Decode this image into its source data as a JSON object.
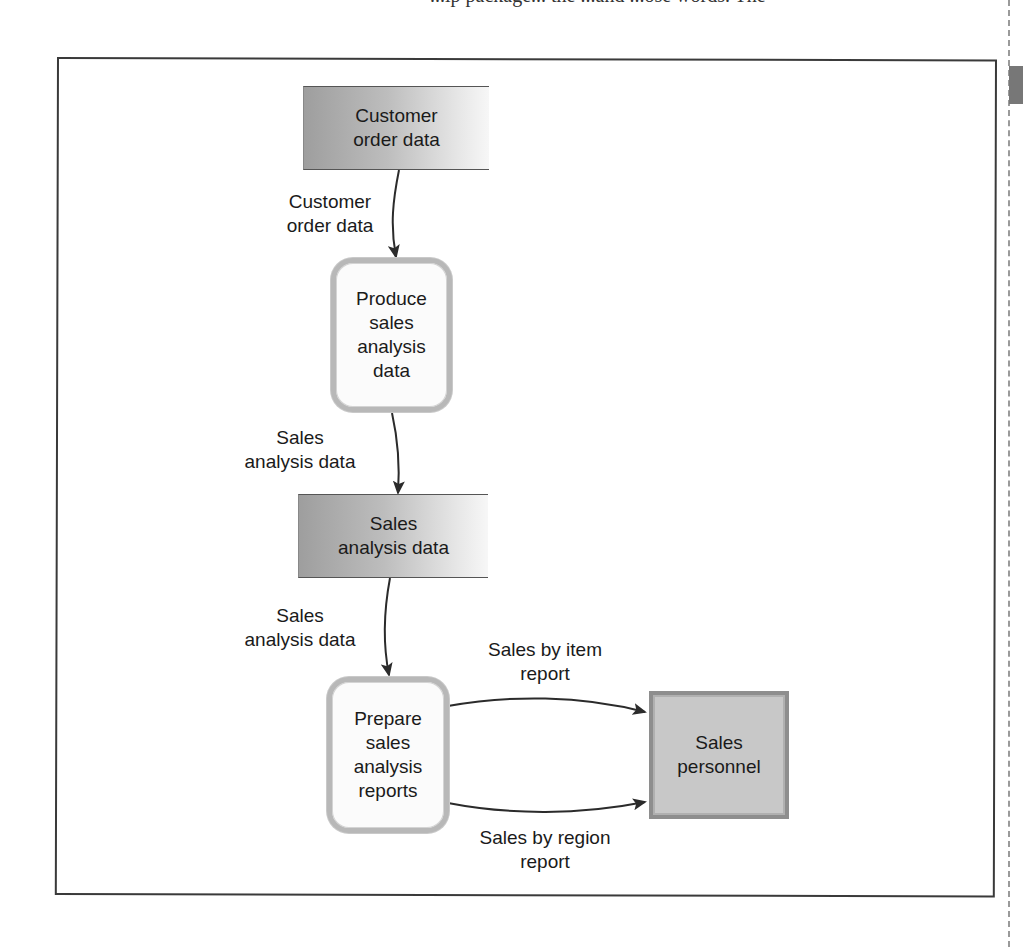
{
  "page": {
    "top_text_fragment": "...ip package... the ...and ...ose words. The"
  },
  "diagram": {
    "type": "data-flow-diagram",
    "data_stores": [
      {
        "id": "store-customer-order",
        "line1": "Customer",
        "line2": "order data"
      },
      {
        "id": "store-sales-analysis",
        "line1": "Sales",
        "line2": "analysis data"
      }
    ],
    "processes": [
      {
        "id": "process-produce",
        "line1": "Produce",
        "line2": "sales",
        "line3": "analysis",
        "line4": "data"
      },
      {
        "id": "process-prepare",
        "line1": "Prepare",
        "line2": "sales",
        "line3": "analysis",
        "line4": "reports"
      }
    ],
    "entities": [
      {
        "id": "entity-sales-personnel",
        "line1": "Sales",
        "line2": "personnel"
      }
    ],
    "flows": [
      {
        "from": "store-customer-order",
        "to": "process-produce",
        "line1": "Customer",
        "line2": "order data"
      },
      {
        "from": "process-produce",
        "to": "store-sales-analysis",
        "line1": "Sales",
        "line2": "analysis data"
      },
      {
        "from": "store-sales-analysis",
        "to": "process-prepare",
        "line1": "Sales",
        "line2": "analysis data"
      },
      {
        "from": "process-prepare",
        "to": "entity-sales-personnel",
        "line1": "Sales by item",
        "line2": "report"
      },
      {
        "from": "process-prepare",
        "to": "entity-sales-personnel",
        "line1": "Sales by region",
        "line2": "report"
      }
    ]
  },
  "colors": {
    "frame": "#3a3a3a",
    "arrow": "#2b2b2b",
    "store_dark": "#9e9e9e",
    "store_light": "#f7f7f7",
    "process_border": "#b8b8b8",
    "entity_fill": "#c8c8c8"
  }
}
